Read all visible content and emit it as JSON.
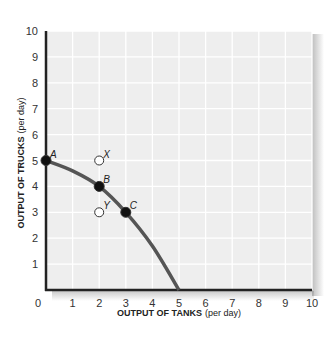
{
  "chart_data": {
    "type": "line",
    "title": "",
    "xlabel": "OUTPUT OF TANKS (per day)",
    "xlabel_bold": "OUTPUT OF TANKS",
    "xlabel_unit": "(per day)",
    "ylabel": "OUTPUT OF TRUCKS (per day)",
    "ylabel_bold": "OUTPUT OF TRUCKS",
    "ylabel_unit": "(per day)",
    "xlim": [
      0,
      10
    ],
    "ylim": [
      0,
      10
    ],
    "x_ticks": [
      "0",
      "1",
      "2",
      "3",
      "4",
      "5",
      "6",
      "7",
      "8",
      "9",
      "10"
    ],
    "y_ticks": [
      "1",
      "2",
      "3",
      "4",
      "5",
      "6",
      "7",
      "8",
      "9",
      "10"
    ],
    "grid": true,
    "series": [
      {
        "name": "Production possibilities frontier",
        "x": [
          0,
          1,
          2,
          3,
          4,
          5
        ],
        "y": [
          5,
          4.6,
          4,
          3,
          1.7,
          0
        ],
        "color": "#555555"
      }
    ],
    "points": [
      {
        "label": "A",
        "x": 0,
        "y": 5,
        "filled": true
      },
      {
        "label": "B",
        "x": 2,
        "y": 4,
        "filled": true
      },
      {
        "label": "C",
        "x": 3,
        "y": 3,
        "filled": true
      },
      {
        "label": "X",
        "x": 2,
        "y": 5,
        "filled": false
      },
      {
        "label": "Y",
        "x": 2,
        "y": 3,
        "filled": false
      }
    ]
  }
}
